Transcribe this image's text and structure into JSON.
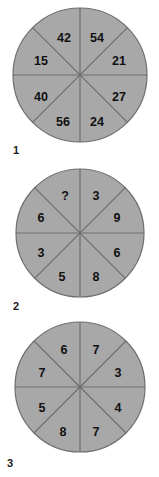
{
  "page": {
    "kind": "visual-reasoning-puzzle",
    "background_color": "#ffffff",
    "wheel_fill_color": "#a8a8a8",
    "wheel_stroke_color": "#6e6e6e",
    "text_color": "#111111"
  },
  "wheels": [
    {
      "label": "1",
      "center": {
        "x": 80,
        "y": 75
      },
      "radius": 67,
      "sectors": [
        {
          "position": "top-right",
          "value": "54"
        },
        {
          "position": "right-upper",
          "value": "21"
        },
        {
          "position": "right-lower",
          "value": "27"
        },
        {
          "position": "bottom-right",
          "value": "24"
        },
        {
          "position": "bottom-left",
          "value": "56"
        },
        {
          "position": "left-lower",
          "value": "40"
        },
        {
          "position": "left-upper",
          "value": "15"
        },
        {
          "position": "top-left",
          "value": "42"
        }
      ]
    },
    {
      "label": "2",
      "center": {
        "x": 80,
        "y": 233
      },
      "radius": 64,
      "sectors": [
        {
          "position": "top-right",
          "value": "3"
        },
        {
          "position": "right-upper",
          "value": "9"
        },
        {
          "position": "right-lower",
          "value": "6"
        },
        {
          "position": "bottom-right",
          "value": "8"
        },
        {
          "position": "bottom-left",
          "value": "5"
        },
        {
          "position": "left-lower",
          "value": "3"
        },
        {
          "position": "left-upper",
          "value": "6"
        },
        {
          "position": "top-left",
          "value": "?"
        }
      ]
    },
    {
      "label": "3",
      "center": {
        "x": 80,
        "y": 387
      },
      "radius": 65,
      "sectors": [
        {
          "position": "top-right",
          "value": "7"
        },
        {
          "position": "right-upper",
          "value": "3"
        },
        {
          "position": "right-lower",
          "value": "4"
        },
        {
          "position": "bottom-right",
          "value": "7"
        },
        {
          "position": "bottom-left",
          "value": "8"
        },
        {
          "position": "left-lower",
          "value": "5"
        },
        {
          "position": "left-upper",
          "value": "7"
        },
        {
          "position": "top-left",
          "value": "6"
        }
      ]
    }
  ]
}
